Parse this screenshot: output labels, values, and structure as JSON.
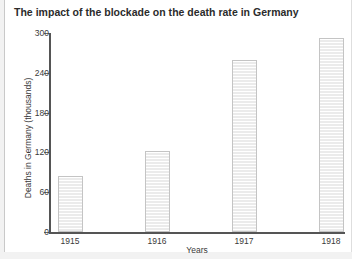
{
  "chart_data": {
    "type": "bar",
    "title": "The impact of the blockade on the death rate in Germany",
    "xlabel": "Years",
    "ylabel": "Deaths in Germany (thousands)",
    "categories": [
      "1915",
      "1916",
      "1917",
      "1918"
    ],
    "values": [
      84,
      122,
      260,
      293
    ],
    "ylim": [
      0,
      300
    ],
    "yticks": [
      0,
      60,
      120,
      180,
      240,
      300
    ],
    "ytick_labels": [
      "0",
      "60",
      "120",
      "180",
      "240",
      "300"
    ],
    "grid": false,
    "legend": null,
    "series": [
      {
        "name": "Deaths in Germany (thousands)",
        "values": [
          84,
          122,
          260,
          293
        ]
      }
    ],
    "colors": {
      "bar_fill": "#f1f1f1",
      "bar_border": "#c4c4c4",
      "axis": "#555555",
      "text": "#3a3a3a",
      "title": "#2b2b2b",
      "page_background": "#f2f2f2",
      "card_background": "#ffffff"
    }
  }
}
